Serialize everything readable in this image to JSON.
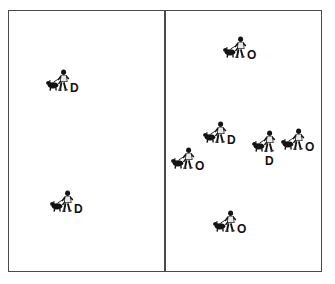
{
  "figure": {
    "background_color": "#ffffff",
    "frame_color": "#4a4a4a",
    "label_color": "#111111",
    "panels": [
      {
        "id": "left",
        "name": "left-panel",
        "marker_count": 2
      },
      {
        "id": "right",
        "name": "right-panel",
        "marker_count": 6
      }
    ]
  },
  "markers": [
    {
      "id": "m1",
      "panel": "left",
      "label": "D",
      "icon": "person-walking-dog-icon",
      "x": 46,
      "y": 67,
      "tag_pos": "tag-right"
    },
    {
      "id": "m2",
      "panel": "left",
      "label": "D",
      "icon": "person-walking-dog-icon",
      "x": 50,
      "y": 188,
      "tag_pos": "tag-right"
    },
    {
      "id": "m3",
      "panel": "right",
      "label": "O",
      "icon": "person-walking-dog-icon",
      "x": 223,
      "y": 34,
      "tag_pos": "tag-right"
    },
    {
      "id": "m4",
      "panel": "right",
      "label": "D",
      "icon": "person-walking-dog-icon",
      "x": 203,
      "y": 119,
      "tag_pos": "tag-right"
    },
    {
      "id": "m5",
      "panel": "right",
      "label": "O",
      "icon": "person-walking-dog-icon",
      "x": 171,
      "y": 145,
      "tag_pos": "tag-right"
    },
    {
      "id": "m6",
      "panel": "right",
      "label": "D",
      "icon": "person-walking-dog-icon",
      "x": 252,
      "y": 128,
      "tag_pos": "tag-below"
    },
    {
      "id": "m7",
      "panel": "right",
      "label": "O",
      "icon": "person-walking-dog-icon",
      "x": 281,
      "y": 126,
      "tag_pos": "tag-right"
    },
    {
      "id": "m8",
      "panel": "right",
      "label": "O",
      "icon": "person-walking-dog-icon",
      "x": 213,
      "y": 208,
      "tag_pos": "tag-right"
    }
  ]
}
